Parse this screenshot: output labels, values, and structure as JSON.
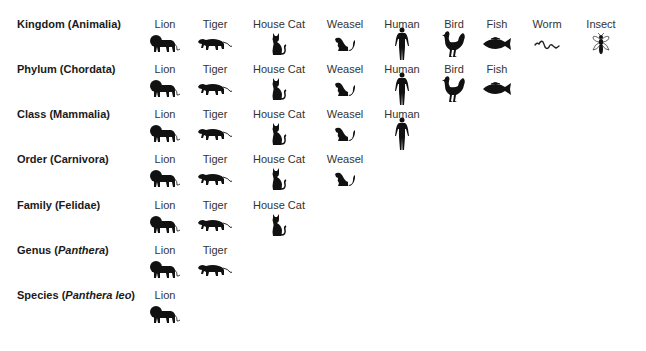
{
  "columns": [
    {
      "id": "lion",
      "name": "Lion",
      "icon": "lion-icon",
      "x": 165
    },
    {
      "id": "tiger",
      "name": "Tiger",
      "icon": "tiger-icon",
      "x": 215
    },
    {
      "id": "housecat",
      "name": "House Cat",
      "icon": "house-cat-icon",
      "x": 279
    },
    {
      "id": "weasel",
      "name": "Weasel",
      "icon": "weasel-icon",
      "x": 345
    },
    {
      "id": "human",
      "name": "Human",
      "icon": "human-icon",
      "x": 402
    },
    {
      "id": "bird",
      "name": "Bird",
      "icon": "bird-icon",
      "x": 454
    },
    {
      "id": "fish",
      "name": "Fish",
      "icon": "fish-icon",
      "x": 497
    },
    {
      "id": "worm",
      "name": "Worm",
      "icon": "worm-icon",
      "x": 547
    },
    {
      "id": "insect",
      "name": "Insect",
      "icon": "insect-icon",
      "x": 601
    }
  ],
  "ranks": [
    {
      "rank": "Kingdom",
      "open": " (",
      "taxon": "Animalia",
      "taxon_italic": false,
      "close": ")",
      "y": 24,
      "members": 9
    },
    {
      "rank": "Phylum",
      "open": " (",
      "taxon": "Chordata",
      "taxon_italic": false,
      "close": ")",
      "y": 69,
      "members": 7
    },
    {
      "rank": "Class",
      "open": " (",
      "taxon": "Mammalia",
      "taxon_italic": false,
      "close": ")",
      "y": 114,
      "members": 5
    },
    {
      "rank": "Order",
      "open": " (",
      "taxon": "Carnivora",
      "taxon_italic": false,
      "close": ")",
      "y": 159,
      "members": 4
    },
    {
      "rank": "Family",
      "open": " (",
      "taxon": "Felidae",
      "taxon_italic": false,
      "close": ")",
      "y": 205,
      "members": 3
    },
    {
      "rank": "Genus",
      "open": " (",
      "taxon": "Panthera",
      "taxon_italic": true,
      "close": ")",
      "y": 250,
      "members": 2
    },
    {
      "rank": "Species",
      "open": " (",
      "taxon": "Panthera leo",
      "taxon_italic": true,
      "close": ")",
      "y": 295,
      "members": 1
    }
  ],
  "icon_offset_y": 22,
  "colors": {
    "label": "#1a1a1a",
    "name": "#333333",
    "icon": "#111111"
  }
}
